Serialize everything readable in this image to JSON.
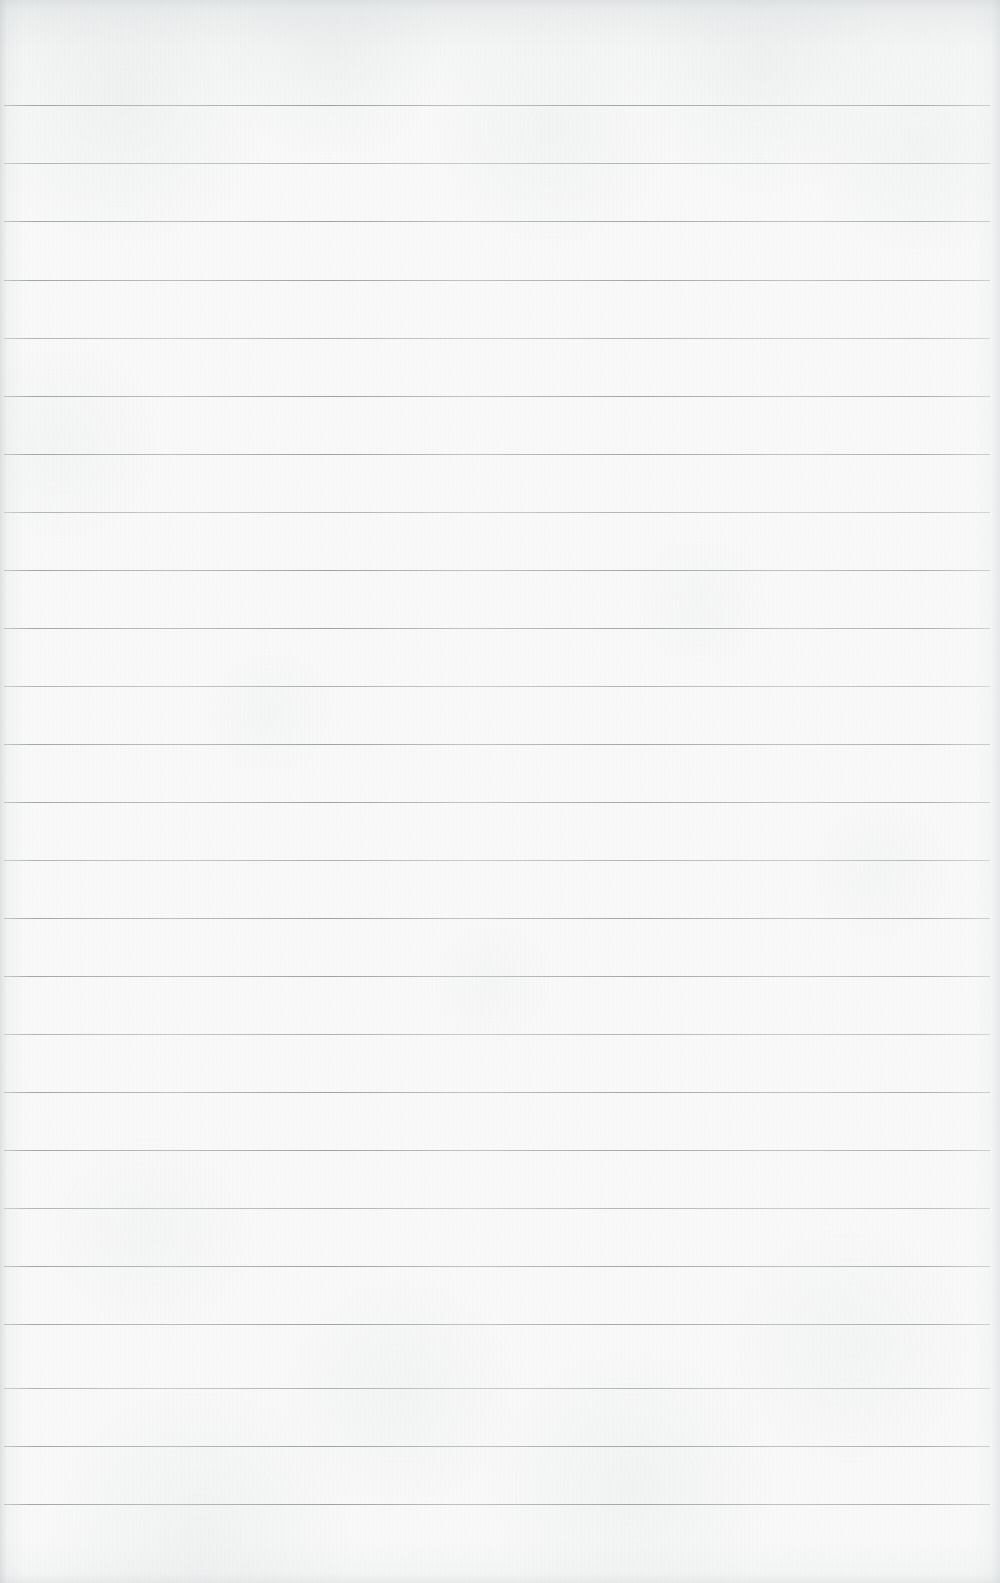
{
  "document": {
    "title": "Blank Ruled Notebook Page",
    "kind": "scanned-paper",
    "text_content": "",
    "note": "No text, headings, handwriting or printed content is present on this page."
  },
  "page": {
    "width": 1000,
    "height": 1583,
    "background_color": "#f8f9f8",
    "paper_color": "#f8f9f8",
    "rule_color": "#8d959c",
    "edge_shadow_color": "#bac0c4"
  },
  "ruling": {
    "type": "horizontal-ruled",
    "line_count": 25,
    "first_line_y": 105,
    "line_spacing": 58,
    "line_thickness": 1,
    "line_start_x": 4,
    "line_end_x": 990,
    "top_margin": 105,
    "bottom_margin": 79,
    "left_margin": 4,
    "right_margin": 10,
    "has_vertical_margin_rule": false,
    "lines_y": [
      105,
      163,
      221,
      280,
      338,
      396,
      454,
      512,
      570,
      628,
      686,
      744,
      802,
      860,
      918,
      976,
      1034,
      1092,
      1150,
      1208,
      1266,
      1324,
      1388,
      1446,
      1504
    ]
  }
}
